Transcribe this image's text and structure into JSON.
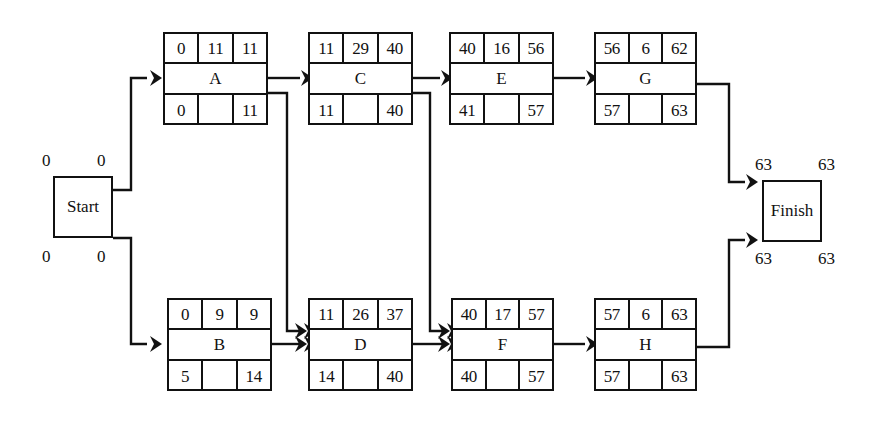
{
  "diagram": {
    "type": "activity-on-node-network",
    "line_color": "#111111",
    "background_color": "#ffffff"
  },
  "start_node": {
    "label": "Start",
    "top_left_value": "0",
    "top_right_value": "0",
    "bottom_left_value": "0",
    "bottom_right_value": "0"
  },
  "finish_node": {
    "label": "Finish",
    "top_left_value": "63",
    "top_right_value": "63",
    "bottom_left_value": "63",
    "bottom_right_value": "63"
  },
  "column_headers": {
    "top_row": [
      "early-start",
      "duration",
      "early-finish"
    ],
    "bottom_row": [
      "late-start",
      "slack",
      "late-finish"
    ]
  },
  "nodes": [
    {
      "id": "A",
      "name": "A",
      "early_start": "0",
      "duration": "11",
      "early_finish": "11",
      "late_start": "0",
      "slack": "",
      "late_finish": "11"
    },
    {
      "id": "C",
      "name": "C",
      "early_start": "11",
      "duration": "29",
      "early_finish": "40",
      "late_start": "11",
      "slack": "",
      "late_finish": "40"
    },
    {
      "id": "E",
      "name": "E",
      "early_start": "40",
      "duration": "16",
      "early_finish": "56",
      "late_start": "41",
      "slack": "",
      "late_finish": "57"
    },
    {
      "id": "G",
      "name": "G",
      "early_start": "56",
      "duration": "6",
      "early_finish": "62",
      "late_start": "57",
      "slack": "",
      "late_finish": "63"
    },
    {
      "id": "B",
      "name": "B",
      "early_start": "0",
      "duration": "9",
      "early_finish": "9",
      "late_start": "5",
      "slack": "",
      "late_finish": "14"
    },
    {
      "id": "D",
      "name": "D",
      "early_start": "11",
      "duration": "26",
      "early_finish": "37",
      "late_start": "14",
      "slack": "",
      "late_finish": "40"
    },
    {
      "id": "F",
      "name": "F",
      "early_start": "40",
      "duration": "17",
      "early_finish": "57",
      "late_start": "40",
      "slack": "",
      "late_finish": "57"
    },
    {
      "id": "H",
      "name": "H",
      "early_start": "57",
      "duration": "6",
      "early_finish": "63",
      "late_start": "57",
      "slack": "",
      "late_finish": "63"
    }
  ],
  "edges": [
    {
      "from": "Start",
      "to": "A"
    },
    {
      "from": "Start",
      "to": "B"
    },
    {
      "from": "A",
      "to": "C"
    },
    {
      "from": "A",
      "to": "D"
    },
    {
      "from": "B",
      "to": "D"
    },
    {
      "from": "C",
      "to": "E"
    },
    {
      "from": "C",
      "to": "F"
    },
    {
      "from": "D",
      "to": "F"
    },
    {
      "from": "E",
      "to": "G"
    },
    {
      "from": "F",
      "to": "H"
    },
    {
      "from": "G",
      "to": "Finish"
    },
    {
      "from": "H",
      "to": "Finish"
    }
  ]
}
